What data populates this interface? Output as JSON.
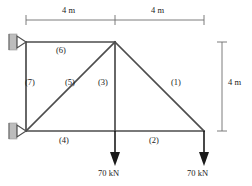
{
  "figure": {
    "type": "truss-free-body-diagram",
    "title": "",
    "units": {
      "length": "m",
      "force": "kN"
    },
    "colors": {
      "member": "#4d4d4d",
      "dimension": "#6e6e6e",
      "load_arrow": "#1a1a1a",
      "support_hatch": "#b3b3b3",
      "text": "#1a1a1a",
      "background": "#ffffff"
    }
  },
  "dimensions": {
    "top": [
      {
        "label": "4 m",
        "x": 72,
        "y": 11
      },
      {
        "label": "4 m",
        "x": 161,
        "y": 11
      }
    ],
    "right": [
      {
        "label": "4 m",
        "x": 228,
        "y": 82
      }
    ]
  },
  "members": [
    {
      "id": "1",
      "label": "(1)",
      "from": "apex",
      "to": "bottom-right",
      "label_x": 178,
      "label_y": 82
    },
    {
      "id": "2",
      "label": "(2)",
      "from": "bottom-mid",
      "to": "bottom-right",
      "label_x": 156,
      "label_y": 140
    },
    {
      "id": "3",
      "label": "(3)",
      "from": "apex",
      "to": "bottom-mid",
      "label_x": 104,
      "label_y": 82
    },
    {
      "id": "4",
      "label": "(4)",
      "from": "bottom-left",
      "to": "bottom-mid",
      "label_x": 66,
      "label_y": 140
    },
    {
      "id": "5",
      "label": "(5)",
      "from": "bottom-left",
      "to": "apex",
      "label_x": 72,
      "label_y": 82
    },
    {
      "id": "6",
      "label": "(6)",
      "from": "top-left",
      "to": "apex",
      "label_x": 63,
      "label_y": 50
    },
    {
      "id": "7",
      "label": "(7)",
      "from": "top-left",
      "to": "bottom-left",
      "label_x": 31,
      "label_y": 82
    }
  ],
  "nodes": [
    {
      "id": "top-left",
      "x": 26,
      "y": 42
    },
    {
      "id": "apex",
      "x": 115,
      "y": 42
    },
    {
      "id": "bottom-left",
      "x": 26,
      "y": 131
    },
    {
      "id": "bottom-mid",
      "x": 115,
      "y": 131
    },
    {
      "id": "bottom-right",
      "x": 204,
      "y": 131
    }
  ],
  "supports": [
    {
      "id": "support-top-left",
      "type": "pin",
      "node": "top-left",
      "x": 26,
      "y": 42
    },
    {
      "id": "support-bottom-left",
      "type": "pin",
      "node": "bottom-left",
      "x": 26,
      "y": 131
    }
  ],
  "loads": [
    {
      "id": "load-mid",
      "label": "70 kN",
      "node": "bottom-mid",
      "magnitude": 70,
      "unit": "kN",
      "direction": "down",
      "x": 115,
      "label_x": 115,
      "label_y": 173
    },
    {
      "id": "load-right",
      "label": "70 kN",
      "node": "bottom-right",
      "magnitude": 70,
      "unit": "kN",
      "direction": "down",
      "x": 204,
      "label_x": 204,
      "label_y": 173
    }
  ]
}
